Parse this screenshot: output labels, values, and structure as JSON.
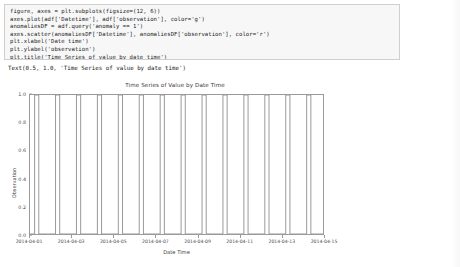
{
  "notebook": {
    "code_lines": [
      "figure, axes = plt.subplots(figsize=(12, 6))",
      "axes.plot(adf['Datetime'], adf['observation'], color='g')",
      "anomaliesDF = adf.query('anomaly == 1')",
      "axes.scatter(anomaliesDF['Datetime'], anomaliesDF['observation'], color='r')",
      "plt.xlabel('Date time')",
      "plt.ylabel('observation')",
      "plt.title('Time Series of value by date time')"
    ],
    "output_text": "Text(0.5, 1.0, 'Time Series of value by date time')"
  },
  "chart_data": {
    "type": "line",
    "title": "Time Series of Value by Date Time",
    "xlabel": "Date Time",
    "ylabel": "Observation",
    "grid": false,
    "legend": null,
    "line_color": "#808080",
    "anomaly_color": "#ff0000",
    "ylim": [
      0.0,
      1.0
    ],
    "ytick_labels": [
      "1.0",
      "0.8",
      "0.6",
      "0.4",
      "0.2",
      "0.0"
    ],
    "ytick_values": [
      1.0,
      0.8,
      0.6,
      0.4,
      0.2,
      0.0
    ],
    "xlim": [
      "2014-04-01",
      "2014-04-15"
    ],
    "xtick_labels": [
      "2014-04-01",
      "2014-04-03",
      "2014-04-05",
      "2014-04-07",
      "2014-04-09",
      "2014-04-11",
      "2014-04-13",
      "2014-04-15"
    ],
    "xtick_values": [
      0,
      2,
      4,
      6,
      8,
      10,
      12,
      14
    ],
    "series": [
      {
        "name": "observation",
        "x": [
          0.0,
          0.22,
          0.22,
          0.42,
          0.42,
          1.0,
          1.22,
          1.22,
          1.42,
          1.42,
          2.0,
          2.22,
          2.22,
          2.42,
          2.42,
          3.0,
          3.22,
          3.22,
          3.42,
          3.42,
          4.0,
          4.22,
          4.22,
          4.42,
          4.42,
          5.0,
          5.22,
          5.22,
          5.42,
          5.42,
          6.0,
          6.22,
          6.22,
          6.42,
          6.42,
          7.0,
          7.22,
          7.22,
          7.42,
          7.42,
          8.0,
          8.22,
          8.22,
          8.42,
          8.42,
          9.0,
          9.22,
          9.22,
          9.42,
          9.42,
          10.0,
          10.22,
          10.22,
          10.42,
          10.42,
          11.0,
          11.22,
          11.22,
          11.42,
          11.42,
          12.0,
          12.22,
          12.22,
          12.42,
          12.42,
          13.0,
          13.22,
          13.22,
          13.42,
          13.42,
          14.0
        ],
        "y": [
          0,
          0,
          1,
          1,
          0,
          0,
          0,
          1,
          1,
          0,
          0,
          0,
          1,
          1,
          0,
          0,
          0,
          1,
          1,
          0,
          0,
          0,
          1,
          1,
          0,
          0,
          0,
          1,
          1,
          0,
          0,
          0,
          1,
          1,
          0,
          0,
          0,
          1,
          1,
          0,
          0,
          0,
          1,
          1,
          0,
          0,
          0,
          1,
          1,
          0,
          0,
          0,
          1,
          1,
          0,
          0,
          0,
          1,
          1,
          0,
          0,
          0,
          1,
          1,
          0,
          0,
          0,
          1,
          1,
          0,
          0
        ]
      }
    ]
  }
}
